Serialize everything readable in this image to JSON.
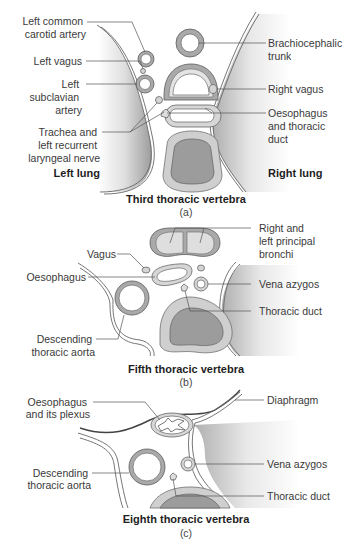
{
  "panels": [
    {
      "id": "a",
      "title": "Third thoracic vertebra",
      "letter": "(a)",
      "labels": {
        "left_common_carotid": [
          "Left common",
          "carotid artery"
        ],
        "left_vagus": [
          "Left vagus"
        ],
        "left_subclavian": [
          "Left",
          "subclavian",
          "artery"
        ],
        "trachea_nerve": [
          "Trachea and",
          "left recurrent",
          "laryngeal nerve"
        ],
        "left_lung": "Left lung",
        "brachiocephalic": [
          "Brachiocephalic",
          "trunk"
        ],
        "right_vagus": [
          "Right vagus"
        ],
        "oesophagus_duct": [
          "Oesophagus",
          "and thoracic",
          "duct"
        ],
        "right_lung": "Right lung"
      }
    },
    {
      "id": "b",
      "title": "Fifth thoracic vertebra",
      "letter": "(b)",
      "labels": {
        "bronchi": [
          "Right and",
          "left principal",
          "bronchi"
        ],
        "vagus": [
          "Vagus"
        ],
        "oesophagus": [
          "Oesophagus"
        ],
        "vena_azygos": [
          "Vena azygos"
        ],
        "thoracic_duct": [
          "Thoracic duct"
        ],
        "aorta": [
          "Descending",
          "thoracic aorta"
        ]
      }
    },
    {
      "id": "c",
      "title": "Eighth thoracic vertebra",
      "letter": "(c)",
      "labels": {
        "oesophagus_plexus": [
          "Oesophagus",
          "and its plexus"
        ],
        "diaphragm": [
          "Diaphragm"
        ],
        "vena_azygos": [
          "Vena azygos"
        ],
        "aorta": [
          "Descending",
          "thoracic aorta"
        ],
        "thoracic_duct": [
          "Thoracic duct"
        ]
      }
    }
  ]
}
